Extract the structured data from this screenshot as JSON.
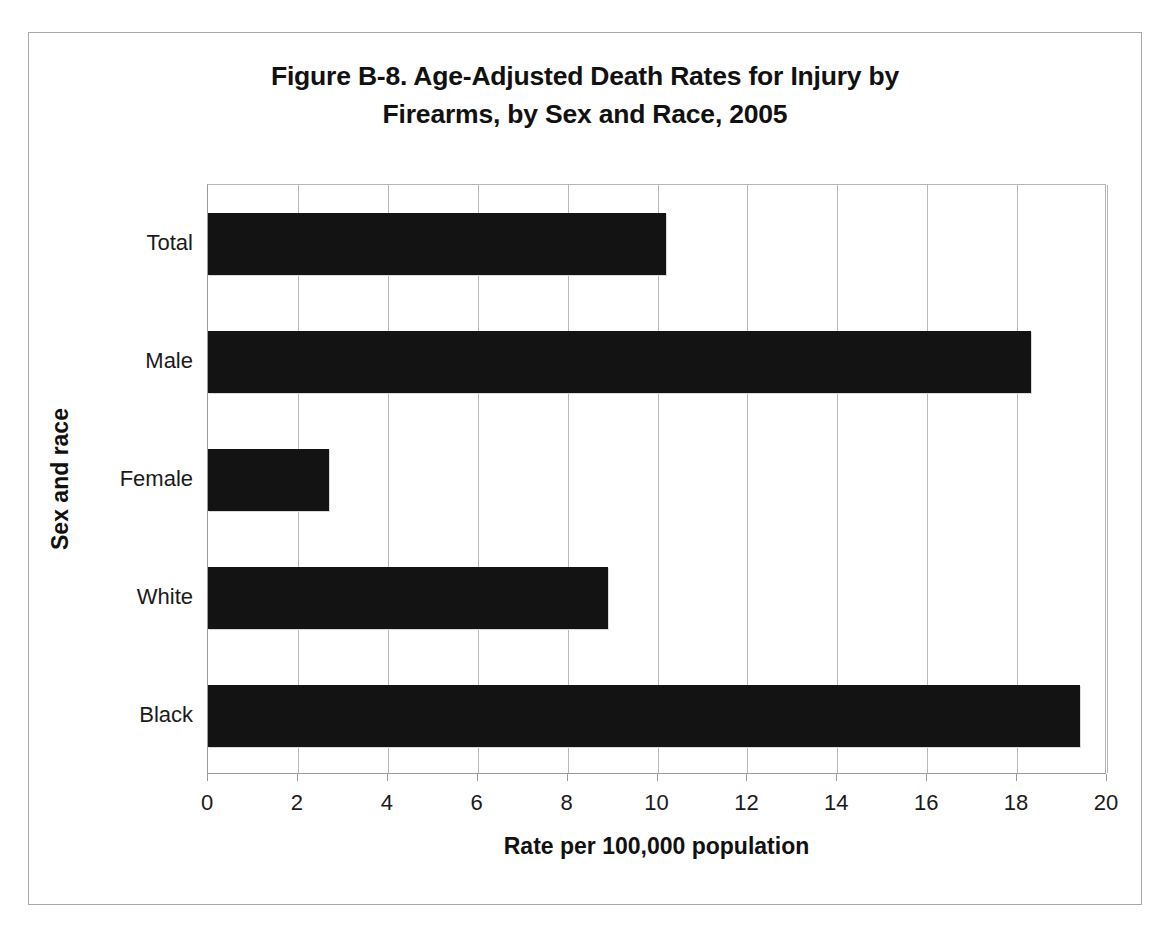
{
  "chart_data": {
    "type": "bar",
    "orientation": "horizontal",
    "title": "Figure B-8. Age-Adjusted Death Rates for Injury by Firearms, by Sex and Race, 2005",
    "title_lines": [
      "Figure B-8. Age-Adjusted Death Rates for Injury by",
      "Firearms, by Sex and Race, 2005"
    ],
    "xlabel": "Rate per 100,000 population",
    "ylabel": "Sex and race",
    "categories": [
      "Total",
      "Male",
      "Female",
      "White",
      "Black"
    ],
    "values": [
      10.2,
      18.3,
      2.7,
      8.9,
      19.4
    ],
    "xlim": [
      0,
      20
    ],
    "xticks": [
      0,
      2,
      4,
      6,
      8,
      10,
      12,
      14,
      16,
      18,
      20
    ],
    "xtick_labels": [
      "0",
      "2",
      "4",
      "6",
      "8",
      "10",
      "12",
      "14",
      "16",
      "18",
      "20"
    ],
    "grid": "vertical-major",
    "legend": "none",
    "bar_color": "#131313",
    "gridline_color": "#b9b9b9",
    "axis_color": "#9a9a9a",
    "background_color": "#ffffff",
    "frame_color": "#a8a8a8"
  }
}
